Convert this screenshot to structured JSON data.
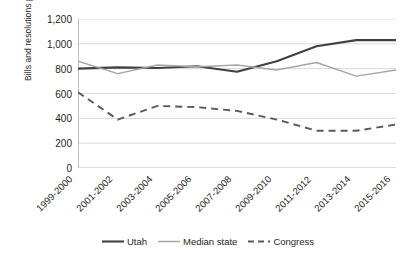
{
  "chart_data": {
    "type": "line",
    "title": "",
    "xlabel": "",
    "ylabel": "Bills and resolutions passed",
    "categories": [
      "1999-2000",
      "2001-2002",
      "2003-2004",
      "2005-2006",
      "2007-2008",
      "2009-2010",
      "2011-2012",
      "2013-2014",
      "2015-2016"
    ],
    "ylim": [
      0,
      1200
    ],
    "yticks": [
      0,
      200,
      400,
      600,
      800,
      1000,
      1200
    ],
    "ytick_labels": [
      "0",
      "200",
      "400",
      "600",
      "800",
      "1,000",
      "1,200"
    ],
    "grid": true,
    "legend_position": "bottom",
    "series": [
      {
        "name": "Utah",
        "style": "solid",
        "color": "#404040",
        "values": [
          800,
          810,
          805,
          820,
          775,
          860,
          980,
          1030,
          1030
        ]
      },
      {
        "name": "Median state",
        "style": "solid",
        "color": "#a6a6a6",
        "values": [
          860,
          760,
          830,
          815,
          830,
          790,
          850,
          740,
          790
        ]
      },
      {
        "name": "Congress",
        "style": "dashed",
        "color": "#595959",
        "values": [
          610,
          390,
          500,
          490,
          460,
          390,
          300,
          300,
          350
        ]
      }
    ]
  },
  "legend": {
    "items": [
      {
        "label": "Utah"
      },
      {
        "label": "Median state"
      },
      {
        "label": "Congress"
      }
    ]
  }
}
